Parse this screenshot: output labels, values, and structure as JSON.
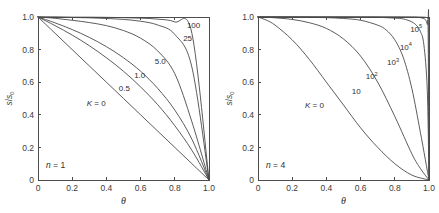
{
  "figure": {
    "background": "#ffffff",
    "axis_color": "#4d4d4d",
    "curve_color": "#4a4a4a",
    "text_color": "#2e2e2e"
  },
  "chart_data": [
    {
      "type": "line",
      "panel": "left",
      "title": "",
      "xlabel": "θ",
      "ylabel": "s/s0",
      "ylabel_num": "s",
      "ylabel_den": "s",
      "ylabel_den_sub": "0",
      "annotation": "n = 1",
      "annotation_italic": "n",
      "annotation_rest": " = 1",
      "xlim": [
        0,
        1
      ],
      "ylim": [
        0,
        1
      ],
      "grid": false,
      "legend": "inline-curve-labels",
      "xticks": [
        "0",
        "0.2",
        "0.4",
        "0.6",
        "0.8",
        "1.0"
      ],
      "xtick_values": [
        0,
        0.2,
        0.4,
        0.6,
        0.8,
        1.0
      ],
      "yticks": [
        "0",
        "0.2",
        "0.4",
        "0.6",
        "0.8",
        "1.0"
      ],
      "ytick_values": [
        0,
        0.2,
        0.4,
        0.6,
        0.8,
        1.0
      ],
      "n": 1,
      "series": [
        {
          "name": "K = 0",
          "label": "K = 0",
          "label_italic": "K",
          "label_rest": " = 0",
          "K": 0,
          "label_x": 0.34,
          "label_y": 0.455,
          "x": [
            0,
            0.1,
            0.2,
            0.3,
            0.4,
            0.5,
            0.6,
            0.7,
            0.8,
            0.9,
            1.0
          ],
          "values": [
            1.0,
            0.9,
            0.8,
            0.7,
            0.6,
            0.5,
            0.4,
            0.3,
            0.2,
            0.1,
            0.0
          ]
        },
        {
          "name": "0.5",
          "label": "0.5",
          "K": 0.5,
          "label_x": 0.505,
          "label_y": 0.545,
          "x": [
            0,
            0.1,
            0.2,
            0.3,
            0.4,
            0.5,
            0.6,
            0.7,
            0.8,
            0.9,
            1.0
          ],
          "values": [
            1.0,
            0.947,
            0.889,
            0.824,
            0.75,
            0.667,
            0.571,
            0.462,
            0.333,
            0.182,
            0.0
          ]
        },
        {
          "name": "1.0",
          "label": "1.0",
          "K": 1.0,
          "label_x": 0.595,
          "label_y": 0.625,
          "x": [
            0,
            0.1,
            0.2,
            0.3,
            0.4,
            0.5,
            0.6,
            0.7,
            0.8,
            0.9,
            1.0
          ],
          "values": [
            1.0,
            0.964,
            0.923,
            0.875,
            0.818,
            0.75,
            0.667,
            0.562,
            0.429,
            0.25,
            0.0
          ]
        },
        {
          "name": "5.0",
          "label": "5.0",
          "K": 5.0,
          "label_x": 0.715,
          "label_y": 0.71,
          "x": [
            0,
            0.1,
            0.2,
            0.3,
            0.4,
            0.5,
            0.6,
            0.7,
            0.8,
            0.9,
            1.0
          ],
          "values": [
            1.0,
            0.992,
            0.98,
            0.966,
            0.947,
            0.917,
            0.87,
            0.792,
            0.652,
            0.357,
            0.0
          ]
        },
        {
          "name": "25",
          "label": "25",
          "K": 25,
          "label_x": 0.875,
          "label_y": 0.855,
          "x": [
            0,
            0.1,
            0.2,
            0.3,
            0.4,
            0.5,
            0.6,
            0.7,
            0.8,
            0.9,
            1.0
          ],
          "values": [
            1.0,
            0.999,
            0.997,
            0.995,
            0.991,
            0.985,
            0.974,
            0.951,
            0.893,
            0.692,
            0.0
          ]
        },
        {
          "name": "100",
          "label": "100",
          "K": 100,
          "label_x": 0.91,
          "label_y": 0.935,
          "x": [
            0,
            0.1,
            0.2,
            0.3,
            0.4,
            0.5,
            0.6,
            0.7,
            0.8,
            0.9,
            1.0
          ],
          "values": [
            1.0,
            1.0,
            0.999,
            0.999,
            0.998,
            0.996,
            0.993,
            0.987,
            0.97,
            0.9,
            0.0
          ]
        }
      ]
    },
    {
      "type": "line",
      "panel": "right",
      "title": "",
      "xlabel": "θ",
      "ylabel": "s/s0",
      "ylabel_num": "s",
      "ylabel_den": "s",
      "ylabel_den_sub": "0",
      "annotation": "n = 4",
      "annotation_italic": "n",
      "annotation_rest": " = 4",
      "xlim": [
        0,
        1
      ],
      "ylim": [
        0,
        1
      ],
      "grid": false,
      "legend": "inline-curve-labels",
      "xticks": [
        "0",
        "0.2",
        "0.4",
        "0.6",
        "0.8",
        "1.0"
      ],
      "xtick_values": [
        0,
        0.2,
        0.4,
        0.6,
        0.8,
        1.0
      ],
      "yticks": [
        "0",
        "0.2",
        "0.4",
        "0.6",
        "0.8",
        "1.0"
      ],
      "ytick_values": [
        0,
        0.2,
        0.4,
        0.6,
        0.8,
        1.0
      ],
      "n": 4,
      "series": [
        {
          "name": "K = 0",
          "label": "K = 0",
          "label_italic": "K",
          "label_rest": " = 0",
          "K": 0,
          "label_x": 0.33,
          "label_y": 0.44,
          "x": [
            0,
            0.05,
            0.1,
            0.2,
            0.3,
            0.4,
            0.5,
            0.6,
            0.7,
            0.8,
            0.9,
            1.0
          ],
          "values": [
            1.0,
            0.98,
            0.95,
            0.86,
            0.74,
            0.6,
            0.46,
            0.32,
            0.2,
            0.1,
            0.03,
            0.0
          ]
        },
        {
          "name": "10",
          "label": "10",
          "K": 10,
          "label_x": 0.575,
          "label_y": 0.525,
          "x": [
            0,
            0.05,
            0.1,
            0.2,
            0.3,
            0.4,
            0.5,
            0.6,
            0.7,
            0.8,
            0.9,
            0.95,
            1.0
          ],
          "values": [
            1.0,
            0.998,
            0.995,
            0.985,
            0.965,
            0.93,
            0.865,
            0.76,
            0.6,
            0.39,
            0.16,
            0.07,
            0.0
          ]
        },
        {
          "name": "10^2",
          "label": "10",
          "label_sup": "2",
          "K": 100,
          "label_x": 0.665,
          "label_y": 0.62,
          "x": [
            0,
            0.1,
            0.2,
            0.3,
            0.4,
            0.5,
            0.6,
            0.7,
            0.75,
            0.8,
            0.85,
            0.9,
            0.95,
            1.0
          ],
          "values": [
            1.0,
            1.0,
            0.999,
            0.998,
            0.996,
            0.991,
            0.98,
            0.95,
            0.92,
            0.86,
            0.75,
            0.56,
            0.29,
            0.0
          ]
        },
        {
          "name": "10^3",
          "label": "10",
          "label_sup": "3",
          "K": 1000,
          "label_x": 0.79,
          "label_y": 0.705,
          "x": [
            0,
            0.2,
            0.4,
            0.6,
            0.7,
            0.8,
            0.85,
            0.9,
            0.93,
            0.95,
            0.97,
            0.99,
            1.0
          ],
          "values": [
            1.0,
            1.0,
            1.0,
            0.999,
            0.998,
            0.993,
            0.988,
            0.97,
            0.945,
            0.91,
            0.83,
            0.55,
            0.0
          ]
        },
        {
          "name": "10^4",
          "label": "10",
          "label_sup": "4",
          "K": 10000,
          "label_x": 0.865,
          "label_y": 0.8,
          "x": [
            0,
            0.3,
            0.6,
            0.8,
            0.9,
            0.93,
            0.95,
            0.97,
            0.98,
            0.99,
            0.995,
            1.0
          ],
          "values": [
            1.0,
            1.0,
            1.0,
            1.0,
            0.999,
            0.998,
            0.996,
            0.99,
            0.982,
            0.955,
            0.9,
            0.0
          ]
        },
        {
          "name": "10^5",
          "label": "10",
          "label_sup": "5",
          "K": 100000,
          "label_x": 0.925,
          "label_y": 0.91,
          "x": [
            0,
            0.4,
            0.7,
            0.9,
            0.95,
            0.97,
            0.98,
            0.99,
            0.995,
            0.998,
            1.0
          ],
          "values": [
            1.0,
            1.0,
            1.0,
            1.0,
            1.0,
            0.999,
            0.998,
            0.995,
            0.988,
            0.97,
            0.0
          ]
        }
      ]
    }
  ]
}
